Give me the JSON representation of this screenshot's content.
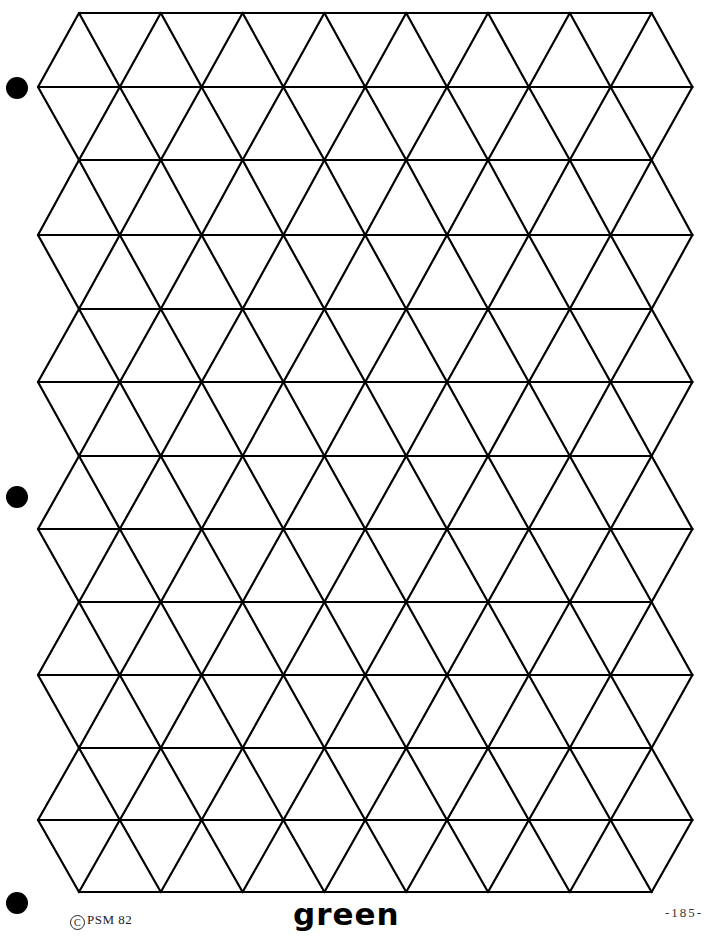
{
  "document": {
    "type": "triangular-grid-worksheet",
    "title": "green",
    "copyright_symbol": "C",
    "copyright_text": "PSM 82",
    "page_number": "-185-"
  },
  "grid": {
    "row_lines_y": [
      13,
      87,
      160,
      235,
      309,
      382,
      456,
      529,
      602,
      675,
      748,
      820,
      892
    ],
    "narrow_left_x": 79,
    "wide_left_x": 38,
    "cell_width": 81.8,
    "columns_narrow": 7,
    "line_color": "#000000",
    "line_width": 2.2
  },
  "hole_punches": [
    {
      "x": 17,
      "y": 88
    },
    {
      "x": 17,
      "y": 497
    },
    {
      "x": 17,
      "y": 903
    }
  ]
}
